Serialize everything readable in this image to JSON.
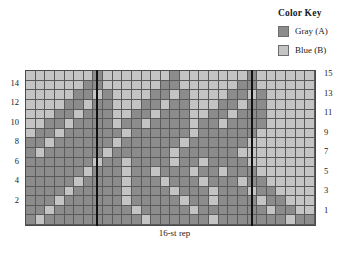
{
  "legend": {
    "title": "Color Key",
    "entries": [
      {
        "label": "Gray (A)",
        "color": "#8c8c8c",
        "symbol": "A"
      },
      {
        "label": "Blue (B)",
        "color": "#c4c4c4",
        "symbol": "B"
      }
    ]
  },
  "repeat": {
    "label": "16-st rep",
    "stitches": 16
  },
  "axis": {
    "left_row_numbers": [
      "14",
      "12",
      "10",
      "8",
      "6",
      "4",
      "2"
    ],
    "right_row_numbers": [
      "15",
      "13",
      "11",
      "9",
      "7",
      "5",
      "3",
      "1"
    ]
  },
  "chart_data": {
    "type": "heatmap",
    "title": "Color Key",
    "xlabel": "",
    "ylabel": "",
    "columns": 30,
    "rows": 16,
    "palette": {
      "A": "#8c8c8c",
      "B": "#c4c4c4"
    },
    "legend_position": "top-right",
    "grid": true,
    "repeat_columns": [
      8,
      23
    ],
    "row_labels_left": [
      "",
      "14",
      "",
      "12",
      "",
      "10",
      "",
      "8",
      "",
      "6",
      "",
      "4",
      "",
      "2",
      "",
      ""
    ],
    "row_labels_right": [
      "15",
      "",
      "13",
      "",
      "11",
      "",
      "9",
      "",
      "7",
      "",
      "5",
      "",
      "3",
      "",
      "1",
      ""
    ],
    "cells": [
      "BBBBBBBABBBBBBBABBBBBBBABBBBBB",
      "BBBBBBAABBBBBBAABBBBBBAABBBBBB",
      "BBBBBAABABBBBAABABBBBAABABBBBB",
      "BBBBAABAABBBAABAABBBAABAABBBBB",
      "BBBAABAAABBAABAAABBAABAAABBBBB",
      "BBAABAAAABAABAAAABAABAAAABBBBB",
      "BAABAAAAAABAAAAAABAAAAAABBBBBB",
      "AABAAAAAABAAAAAABAAAAAABBBBBBB",
      "ABAAAAAABAAAAAABAAAAAABBBBBBBB",
      "AAAAAAABAABAAAABAABAAAABBBBBBB",
      "AAAAAABAAABAABAAABAABAAABBBBBB",
      "AAAAABAAAABAAABAAABAAABAABBBBB",
      "AAAABAAAAABAAAABAAABAAABAABBBB",
      "AAABAAAAAABAAAAABAABAAAABAABBB",
      "AABAAAAAAAABAAAAABAAAAAAABAABB",
      "ABAAAAAAAAAABAAAAAABAAAAAAABAA"
    ]
  }
}
